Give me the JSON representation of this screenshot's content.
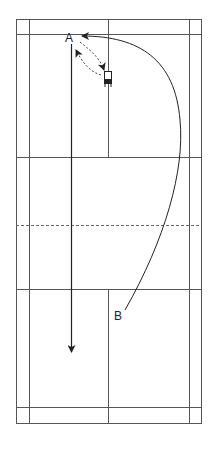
{
  "diagram": {
    "type": "badminton-court-drill",
    "colors": {
      "line": "#555555",
      "path": "#222222",
      "background": "#ffffff"
    },
    "labels": [
      {
        "id": "A",
        "text": "A",
        "x": 67,
        "y": 42
      },
      {
        "id": "B",
        "text": "B",
        "x": 114,
        "y": 318
      }
    ],
    "court": {
      "outer": {
        "x1": 16,
        "y1": 19,
        "x2": 201,
        "y2": 423
      },
      "singles_sidelines": [
        29,
        189
      ],
      "long_service_lines": [
        34,
        407
      ],
      "short_service_lines": [
        157,
        289
      ],
      "center_line_x": 108,
      "net_y": 225
    },
    "icons": [
      {
        "name": "player-chair-icon",
        "x": 104,
        "y": 71
      }
    ],
    "paths": [
      {
        "name": "shuttle-arc-B-to-A",
        "style": "solid",
        "from": "B",
        "to": "A"
      },
      {
        "name": "movement-A-to-base",
        "style": "dashed",
        "from": "A",
        "to": "base"
      },
      {
        "name": "movement-base-to-A",
        "style": "dashed",
        "from": "base",
        "to": "A"
      },
      {
        "name": "straight-drop-from-A",
        "style": "solid",
        "from": "A",
        "to": "rear"
      }
    ]
  }
}
